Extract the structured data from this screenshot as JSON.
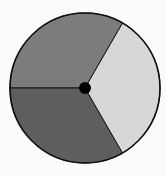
{
  "spinner": {
    "description": "Circular spinner divided into three equal sectors with a center pivot",
    "center": [
      85,
      88
    ],
    "radius": 75,
    "outline_color": "#111111",
    "hub_radius": 6,
    "hub_color": "#000000",
    "background": "#fbfbfb",
    "sectors": [
      {
        "name": "upper-left",
        "start_deg": 180,
        "end_deg": 60,
        "fill": "#7c7c7c",
        "fraction": "1/3"
      },
      {
        "name": "lower-left",
        "start_deg": 180,
        "end_deg": 300,
        "fill": "#5e5e5e",
        "fraction": "1/3"
      },
      {
        "name": "right",
        "start_deg": 60,
        "end_deg": -60,
        "fill": "#d7d7d7",
        "fraction": "1/3"
      }
    ]
  }
}
